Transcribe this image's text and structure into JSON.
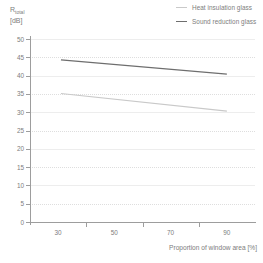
{
  "chart_data": {
    "type": "line",
    "title": "",
    "xlabel": "Proportion of window area [%]",
    "ylabel": "R_total [dB]",
    "ylabel_symbol": "R",
    "ylabel_subscript": "total",
    "ylabel_unit": "[dB]",
    "xlim": [
      20,
      100
    ],
    "ylim": [
      0,
      50
    ],
    "xticks": [
      30,
      50,
      70,
      90
    ],
    "xtick_labels": [
      "30",
      "50",
      "70",
      "90"
    ],
    "xtick_marks": [
      40,
      60,
      80
    ],
    "yticks": [
      0,
      5,
      10,
      15,
      20,
      25,
      30,
      35,
      40,
      45,
      50
    ],
    "ytick_labels": [
      "0",
      "5",
      "10",
      "15",
      "20",
      "25",
      "30",
      "35",
      "40",
      "45",
      "50"
    ],
    "grid": true,
    "legend_position": "top-right",
    "x": [
      31,
      90
    ],
    "series": [
      {
        "name": "Sound reduction glass",
        "color": "#6e6e6e",
        "values": [
          44.3,
          40.4
        ]
      },
      {
        "name": "Heat insulation glass",
        "color": "#c9c9c9",
        "values": [
          35.1,
          30.3
        ]
      }
    ]
  },
  "legend": {
    "items": [
      {
        "label": "Heat insulation glass",
        "color": "#c9c9c9",
        "swatch": "line-swatch-light"
      },
      {
        "label": "Sound reduction glass",
        "color": "#6e6e6e",
        "swatch": "line-swatch-dark"
      }
    ]
  },
  "axes": {
    "y_title_symbol": "R",
    "y_title_sub": "total",
    "y_title_unit": "[dB]",
    "x_title": "Proportion of window area [%]",
    "y_labels": [
      "50",
      "45",
      "40",
      "35",
      "30",
      "25",
      "20",
      "15",
      "10",
      "5",
      "0"
    ],
    "x_labels": [
      "30",
      "50",
      "70",
      "90"
    ]
  },
  "colors": {
    "axis": "#9d9d9d",
    "grid": "#dedede",
    "text": "#7d7d7d",
    "series_light": "#c9c9c9",
    "series_dark": "#6e6e6e",
    "background": "#ffffff"
  }
}
